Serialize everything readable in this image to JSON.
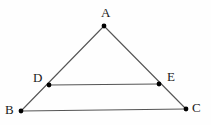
{
  "figure": {
    "kind": "geometry-diagram",
    "canvas": {
      "width": 211,
      "height": 125
    },
    "background_color": "#fefefe",
    "line_color": "#555555",
    "point_color": "#000000",
    "label_color": "#1a1a1a",
    "line_width": 1.1,
    "point_radius": 2.4,
    "points": [
      {
        "id": "A",
        "label": "A",
        "x": 104,
        "y": 26,
        "label_x": 101,
        "label_y": 6
      },
      {
        "id": "B",
        "label": "B",
        "x": 21,
        "y": 111,
        "label_x": 5,
        "label_y": 103
      },
      {
        "id": "C",
        "label": "C",
        "x": 186,
        "y": 109,
        "label_x": 192,
        "label_y": 101
      },
      {
        "id": "D",
        "label": "D",
        "x": 49,
        "y": 85,
        "label_x": 33,
        "label_y": 71
      },
      {
        "id": "E",
        "label": "E",
        "x": 159,
        "y": 84,
        "label_x": 167,
        "label_y": 70
      }
    ],
    "segments": [
      {
        "id": "AB",
        "from": "A",
        "to": "B",
        "x1": 104,
        "y1": 26,
        "x2": 21,
        "y2": 111
      },
      {
        "id": "AC",
        "from": "A",
        "to": "C",
        "x1": 104,
        "y1": 26,
        "x2": 186,
        "y2": 109
      },
      {
        "id": "BC",
        "from": "B",
        "to": "C",
        "x1": 21,
        "y1": 111,
        "x2": 186,
        "y2": 109
      },
      {
        "id": "DE",
        "from": "D",
        "to": "E",
        "x1": 49,
        "y1": 85,
        "x2": 159,
        "y2": 84
      }
    ]
  }
}
